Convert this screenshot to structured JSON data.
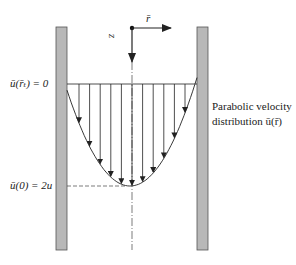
{
  "diagram": {
    "labels": {
      "wall_condition": "ū(r̄ₜ) = 0",
      "centerline_velocity": "ū(0) = 2u",
      "profile_caption_line1": "Parabolic velocity",
      "profile_caption_line2": "distribution ū(r̄)",
      "r_axis": "r̄",
      "z_axis": "z"
    },
    "profile": {
      "type": "parabolic",
      "arrow_count": 11,
      "max_velocity_ratio": 2
    },
    "colors": {
      "wall_fill": "#b8b8b8",
      "wall_stroke": "#555555",
      "line": "#222222"
    }
  }
}
